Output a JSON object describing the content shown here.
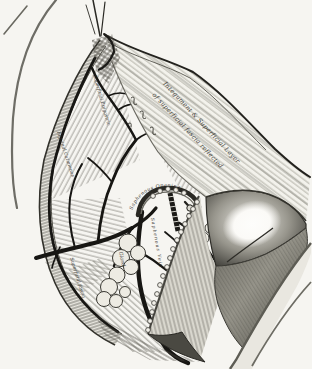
{
  "palette": {
    "paper": "#f6f5f1",
    "ink": "#1c1b18",
    "shade_dark": "#3e3d38",
    "shade_mid": "#8b8a82",
    "highlight": "#fdfdfb"
  },
  "engraving": {
    "labels": {
      "flap_line1": "Integument & Superficial Layer",
      "flap_line2": "of superficial fascia reflected",
      "vessel_upper": "Superficial Epigastric",
      "vessel_left": "Inguinal Cutaneous",
      "fascia_lower_left": "Superficial fascia",
      "saphenous_opening": "Saphenous Opening",
      "saphenous_vein": "Saphenous Vein",
      "gland": "Gland"
    }
  }
}
